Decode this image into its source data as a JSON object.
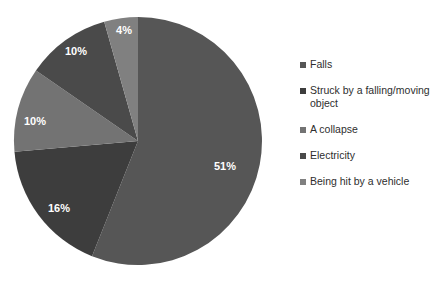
{
  "chart_data": {
    "type": "pie",
    "title": "",
    "subtitle": "",
    "xlabel": "",
    "ylabel": "",
    "legend_position": "right",
    "grid": false,
    "start_angle_deg": 0,
    "direction": "clockwise",
    "categories": [
      "Falls",
      "Struck by a falling/moving object",
      "A collapse",
      "Electricity",
      "Being hit by a vehicle"
    ],
    "values": [
      51,
      16,
      10,
      10,
      4
    ],
    "value_labels": [
      "51%",
      "16%",
      "10%",
      "10%",
      "4%"
    ],
    "colors": [
      "#565656",
      "#3d3d3d",
      "#737373",
      "#4a4a4a",
      "#808080"
    ],
    "slices": [
      {
        "label": "Falls",
        "value": 51,
        "value_label": "51%",
        "color": "#565656",
        "label_x": 225,
        "label_y": 167
      },
      {
        "label": "Struck by a falling/moving object",
        "value": 16,
        "value_label": "16%",
        "color": "#3d3d3d",
        "label_x": 59,
        "label_y": 209
      },
      {
        "label": "A collapse",
        "value": 10,
        "value_label": "10%",
        "color": "#737373",
        "label_x": 35,
        "label_y": 122
      },
      {
        "label": "Electricity",
        "value": 10,
        "value_label": "10%",
        "color": "#4a4a4a",
        "label_x": 76,
        "label_y": 52
      },
      {
        "label": "Being hit by a vehicle",
        "value": 4,
        "value_label": "4%",
        "color": "#808080",
        "label_x": 124,
        "label_y": 31
      }
    ]
  },
  "legend": {
    "items": [
      {
        "label": "Falls",
        "color": "#565656"
      },
      {
        "label": "Struck by a falling/moving\nobject",
        "color": "#3d3d3d"
      },
      {
        "label": "A collapse",
        "color": "#737373"
      },
      {
        "label": "Electricity",
        "color": "#4a4a4a"
      },
      {
        "label": "Being hit by a vehicle",
        "color": "#808080"
      }
    ]
  },
  "geometry": {
    "center_x": 138,
    "center_y": 141,
    "radius": 124
  }
}
